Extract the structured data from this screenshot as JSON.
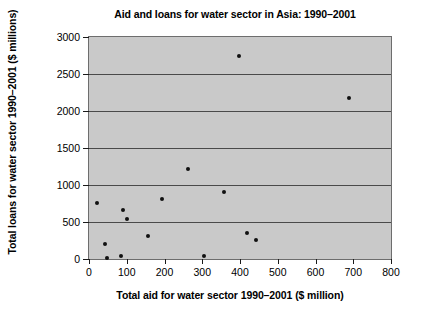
{
  "chart_data": {
    "type": "scatter",
    "title": "Aid and loans for water sector in Asia: 1990–2001",
    "xlabel": "Total aid for water sector 1990–2001 ($ million)",
    "ylabel": "Total loans for water sector 1990–2001 ($ millions)",
    "xlim": [
      0,
      800
    ],
    "ylim": [
      0,
      3000
    ],
    "xticks": [
      0,
      100,
      200,
      300,
      400,
      500,
      600,
      700,
      800
    ],
    "yticks": [
      0,
      500,
      1000,
      1500,
      2000,
      2500,
      3000
    ],
    "xtick_labels": [
      "0",
      "100",
      "200",
      "300",
      "400",
      "500",
      "600",
      "700",
      "800"
    ],
    "ytick_labels": [
      "0",
      "500",
      "1000",
      "1500",
      "2000",
      "2500",
      "3000"
    ],
    "grid": "horizontal",
    "legend": null,
    "plot_background": "#c9c9c9",
    "marker_color": "#101010",
    "gridline_color": "#4a4a4a",
    "points": [
      {
        "x": 22,
        "y": 760
      },
      {
        "x": 42,
        "y": 205
      },
      {
        "x": 48,
        "y": 15
      },
      {
        "x": 86,
        "y": 45
      },
      {
        "x": 90,
        "y": 665
      },
      {
        "x": 100,
        "y": 540
      },
      {
        "x": 155,
        "y": 305
      },
      {
        "x": 193,
        "y": 805
      },
      {
        "x": 262,
        "y": 1220
      },
      {
        "x": 305,
        "y": 40
      },
      {
        "x": 358,
        "y": 900
      },
      {
        "x": 398,
        "y": 2740
      },
      {
        "x": 418,
        "y": 350
      },
      {
        "x": 442,
        "y": 260
      },
      {
        "x": 688,
        "y": 2170
      }
    ]
  }
}
